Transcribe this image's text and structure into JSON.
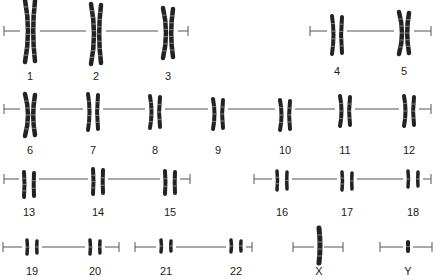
{
  "figure": {
    "type": "karyotype",
    "ink_color": "#222222",
    "line_color": "#555555",
    "rows": [
      {
        "y_line": 31,
        "x_start": 4,
        "x_end": 188,
        "chromosomes": [
          {
            "label": "1",
            "x": 30,
            "y_top": 0,
            "y_bot": 62,
            "label_y": 71
          },
          {
            "label": "2",
            "x": 96,
            "y_top": 4,
            "y_bot": 64,
            "label_y": 71
          },
          {
            "label": "3",
            "x": 168,
            "y_top": 8,
            "y_bot": 58,
            "label_y": 71
          }
        ]
      },
      {
        "y_line": 31,
        "x_start": 310,
        "x_end": 431,
        "chromosomes": [
          {
            "label": "4",
            "x": 337,
            "y_top": 16,
            "y_bot": 54,
            "label_y": 66
          },
          {
            "label": "5",
            "x": 404,
            "y_top": 12,
            "y_bot": 54,
            "label_y": 66
          }
        ]
      },
      {
        "y_line": 109,
        "x_start": 4,
        "x_end": 431,
        "chromosomes": [
          {
            "label": "6",
            "x": 30,
            "y_top": 94,
            "y_bot": 136,
            "label_y": 145
          },
          {
            "label": "7",
            "x": 93,
            "y_top": 94,
            "y_bot": 130,
            "label_y": 145
          },
          {
            "label": "8",
            "x": 155,
            "y_top": 96,
            "y_bot": 128,
            "label_y": 145
          },
          {
            "label": "9",
            "x": 218,
            "y_top": 99,
            "y_bot": 129,
            "label_y": 145
          },
          {
            "label": "10",
            "x": 285,
            "y_top": 100,
            "y_bot": 130,
            "label_y": 145
          },
          {
            "label": "11",
            "x": 345,
            "y_top": 96,
            "y_bot": 126,
            "label_y": 145
          },
          {
            "label": "12",
            "x": 409,
            "y_top": 96,
            "y_bot": 126,
            "label_y": 145
          }
        ]
      },
      {
        "y_line": 179,
        "x_start": 4,
        "x_end": 190,
        "chromosomes": [
          {
            "label": "13",
            "x": 29,
            "y_top": 172,
            "y_bot": 197,
            "label_y": 207
          },
          {
            "label": "14",
            "x": 98,
            "y_top": 169,
            "y_bot": 194,
            "label_y": 207
          },
          {
            "label": "15",
            "x": 170,
            "y_top": 171,
            "y_bot": 194,
            "label_y": 207
          }
        ]
      },
      {
        "y_line": 179,
        "x_start": 254,
        "x_end": 431,
        "chromosomes": [
          {
            "label": "16",
            "x": 282,
            "y_top": 171,
            "y_bot": 190,
            "label_y": 207
          },
          {
            "label": "17",
            "x": 347,
            "y_top": 172,
            "y_bot": 190,
            "label_y": 207
          },
          {
            "label": "18",
            "x": 413,
            "y_top": 171,
            "y_bot": 187,
            "label_y": 207
          }
        ]
      },
      {
        "y_line": 247,
        "x_start": 3,
        "x_end": 119,
        "chromosomes": [
          {
            "label": "19",
            "x": 32,
            "y_top": 240,
            "y_bot": 254,
            "label_y": 266
          },
          {
            "label": "20",
            "x": 95,
            "y_top": 240,
            "y_bot": 254,
            "label_y": 266
          }
        ]
      },
      {
        "y_line": 247,
        "x_start": 135,
        "x_end": 252,
        "chromosomes": [
          {
            "label": "21",
            "x": 166,
            "y_top": 240,
            "y_bot": 252,
            "label_y": 266
          },
          {
            "label": "22",
            "x": 236,
            "y_top": 240,
            "y_bot": 252,
            "label_y": 266
          }
        ]
      },
      {
        "y_line": 247,
        "x_start": 293,
        "x_end": 343,
        "chromosomes": [
          {
            "label": "X",
            "x": 319,
            "y_top": 228,
            "y_bot": 263,
            "label_y": 266,
            "single": true
          }
        ]
      },
      {
        "y_line": 247,
        "x_start": 380,
        "x_end": 432,
        "chromosomes": [
          {
            "label": "Y",
            "x": 408,
            "y_top": 242,
            "y_bot": 251,
            "label_y": 266,
            "single": true
          }
        ]
      }
    ]
  }
}
